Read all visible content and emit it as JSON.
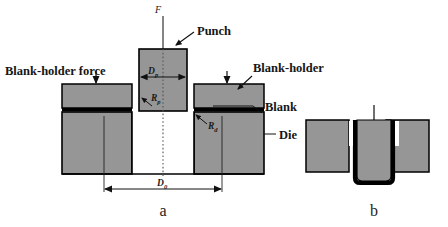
{
  "figure": {
    "background_color": "#ffffff",
    "metal_fill_color": "#969696",
    "outline_color": "#000000",
    "blank_color": "#000000",
    "cavity_color": "#ffffff"
  },
  "panel_a": {
    "caption": "a",
    "labels": {
      "force": "F",
      "punch": "Punch",
      "blank_holder_force": "Blank-holder force",
      "blank_holder": "Blank-holder",
      "blank": "Blank",
      "die": "Die"
    },
    "dimensions": {
      "punch_diameter_symbol": "D",
      "punch_diameter_subscript": "p",
      "blank_diameter_symbol": "D",
      "blank_diameter_subscript": "0",
      "punch_radius_symbol": "R",
      "punch_radius_subscript": "p",
      "die_radius_symbol": "R",
      "die_radius_subscript": "d"
    }
  },
  "panel_b": {
    "caption": "b",
    "description": "Drawn cup formed between punch and die"
  }
}
